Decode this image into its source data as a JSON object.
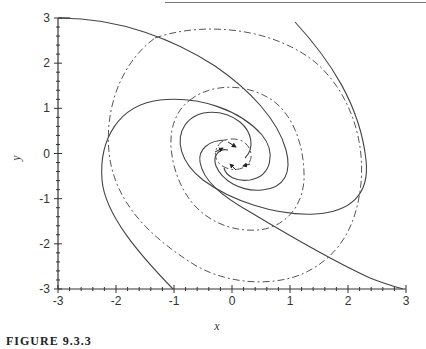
{
  "chart_data": {
    "type": "line",
    "title": "",
    "subtitle": "",
    "xlabel": "x",
    "ylabel": "y",
    "xlim": [
      -3,
      3
    ],
    "ylim": [
      -3,
      3
    ],
    "x_ticks": [
      "-3",
      "-2",
      "-1",
      "0",
      "1",
      "2",
      "3"
    ],
    "y_ticks": [
      "-3",
      "-2",
      "-1",
      "0",
      "1",
      "2",
      "3"
    ],
    "grid": false,
    "legend": null,
    "series": [
      {
        "name": "solid trajectory from (-3, 3)",
        "style": "solid",
        "points": [
          [
            -3,
            3
          ],
          [
            -1.3,
            2.8
          ],
          [
            0.3,
            2.0
          ],
          [
            0.9,
            1.0
          ],
          [
            1.0,
            -0.3
          ],
          [
            0.5,
            -0.8
          ],
          [
            0.0,
            -0.6
          ],
          [
            -0.1,
            0.0
          ]
        ]
      },
      {
        "name": "solid trajectory from (1.1, 2.9)",
        "style": "solid",
        "points": [
          [
            1.1,
            2.9
          ],
          [
            1.8,
            1.8
          ],
          [
            2.3,
            0.5
          ],
          [
            2.3,
            -1.0
          ],
          [
            1.5,
            -1.4
          ],
          [
            0.5,
            -1.2
          ],
          [
            -0.7,
            -0.4
          ],
          [
            -1.0,
            0.5
          ],
          [
            -0.3,
            1.0
          ],
          [
            0.5,
            0.6
          ]
        ]
      },
      {
        "name": "solid trajectory from (-1, -3)",
        "style": "solid",
        "points": [
          [
            -1,
            -3
          ],
          [
            -1.6,
            -2.0
          ],
          [
            -2.2,
            -0.6
          ],
          [
            -2.1,
            0.6
          ],
          [
            -1.4,
            1.2
          ],
          [
            -0.4,
            1.2
          ],
          [
            0.5,
            0.5
          ],
          [
            0.6,
            -0.2
          ],
          [
            0.2,
            -0.5
          ]
        ]
      },
      {
        "name": "solid trajectory to (3, -3)",
        "style": "solid",
        "points": [
          [
            -0.8,
            0.3
          ],
          [
            -0.9,
            -0.3
          ],
          [
            -0.3,
            -1.1
          ],
          [
            0.7,
            -2.0
          ],
          [
            1.7,
            -2.6
          ],
          [
            3,
            -3
          ]
        ]
      },
      {
        "name": "dash-dot outer",
        "style": "dash-dot",
        "points": [
          [
            -1.3,
            2.6
          ],
          [
            0,
            2.9
          ],
          [
            1.4,
            2.2
          ],
          [
            2.3,
            0.5
          ],
          [
            2.2,
            -1.3
          ],
          [
            1.3,
            -2.6
          ],
          [
            0.1,
            -2.8
          ],
          [
            -0.8,
            -2.3
          ],
          [
            -1.8,
            -0.9
          ],
          [
            -1.9,
            0.8
          ],
          [
            -1.3,
            2.6
          ]
        ]
      },
      {
        "name": "dash-dot inner",
        "style": "dash-dot",
        "points": [
          [
            -0.6,
            1.0
          ],
          [
            0,
            1.5
          ],
          [
            0.9,
            1.2
          ],
          [
            1.3,
            0.0
          ],
          [
            1.2,
            -1.0
          ],
          [
            0.5,
            -1.6
          ],
          [
            -0.4,
            -1.3
          ],
          [
            -0.8,
            -0.5
          ],
          [
            -0.6,
            1.0
          ]
        ]
      },
      {
        "name": "dash-dot innermost",
        "style": "dash-dot",
        "points": [
          [
            -0.2,
            0.2
          ],
          [
            0.1,
            0.35
          ],
          [
            0.35,
            0.0
          ],
          [
            0.15,
            -0.35
          ],
          [
            -0.2,
            -0.2
          ],
          [
            -0.2,
            0.2
          ]
        ]
      }
    ],
    "annotations": [
      "direction arrows on trajectories near origin"
    ]
  },
  "figure": {
    "caption": "FIGURE 9.3.3"
  }
}
